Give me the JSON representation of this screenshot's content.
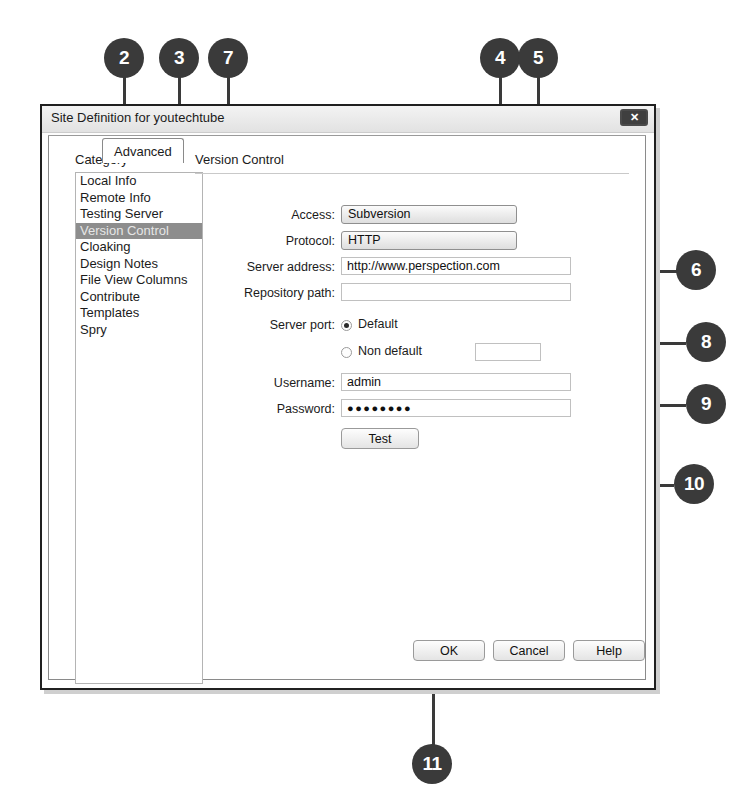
{
  "window": {
    "title": "Site Definition for youtechtube",
    "close_label": "✕"
  },
  "tabs": [
    {
      "label": "Basic",
      "active": false
    },
    {
      "label": "Advanced",
      "active": true
    }
  ],
  "category": {
    "header": "Category",
    "items": [
      {
        "label": "Local Info",
        "selected": false
      },
      {
        "label": "Remote Info",
        "selected": false
      },
      {
        "label": "Testing Server",
        "selected": false
      },
      {
        "label": "Version Control",
        "selected": true
      },
      {
        "label": "Cloaking",
        "selected": false
      },
      {
        "label": "Design Notes",
        "selected": false
      },
      {
        "label": "File View Columns",
        "selected": false
      },
      {
        "label": "Contribute",
        "selected": false
      },
      {
        "label": "Templates",
        "selected": false
      },
      {
        "label": "Spry",
        "selected": false
      }
    ]
  },
  "panel": {
    "section_title": "Version Control",
    "fields": {
      "access_label": "Access:",
      "access_value": "Subversion",
      "protocol_label": "Protocol:",
      "protocol_value": "HTTP",
      "server_address_label": "Server address:",
      "server_address_value": "http://www.perspection.com",
      "repository_path_label": "Repository path:",
      "repository_path_value": "",
      "server_port_label": "Server port:",
      "port_default_label": "Default",
      "port_nondefault_label": "Non default",
      "port_nondefault_value": "",
      "port_selected": "default",
      "username_label": "Username:",
      "username_value": "admin",
      "password_label": "Password:",
      "password_value": "●●●●●●●●",
      "test_label": "Test"
    }
  },
  "footer": {
    "ok_label": "OK",
    "cancel_label": "Cancel",
    "help_label": "Help"
  },
  "callouts": [
    {
      "number": "2"
    },
    {
      "number": "3"
    },
    {
      "number": "7"
    },
    {
      "number": "4"
    },
    {
      "number": "5"
    },
    {
      "number": "6"
    },
    {
      "number": "8"
    },
    {
      "number": "9"
    },
    {
      "number": "10"
    },
    {
      "number": "11"
    }
  ],
  "colors": {
    "callout_fill": "#3a3a3a",
    "callout_text": "#ffffff",
    "selection": "#8d8d8d",
    "dialog_border": "#1f1f1f"
  }
}
